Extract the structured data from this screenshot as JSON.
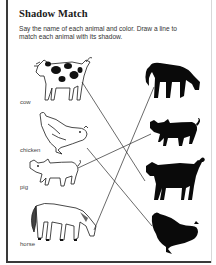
{
  "worksheet": {
    "title": "Shadow Match",
    "instructions": "Say the name of each animal and color. Draw a line to match each animal with its shadow."
  },
  "animals": [
    {
      "name": "cow",
      "label": "cow"
    },
    {
      "name": "chicken",
      "label": "chicken"
    },
    {
      "name": "pig",
      "label": "pig"
    },
    {
      "name": "horse",
      "label": "horse"
    }
  ],
  "shadows": [
    "horse",
    "pig",
    "cow",
    "chicken"
  ],
  "matches": [
    {
      "from": "cow",
      "to": "cow"
    },
    {
      "from": "chicken",
      "to": "chicken"
    },
    {
      "from": "pig",
      "to": "pig"
    },
    {
      "from": "horse",
      "to": "horse"
    }
  ],
  "colors": {
    "ink": "#1a1a1a",
    "silhouette": "#0a0a0a",
    "frame": "#3a3a3a",
    "background": "#ffffff"
  }
}
